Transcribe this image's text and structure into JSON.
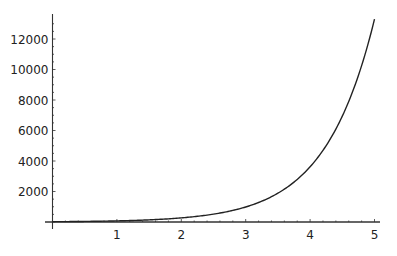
{
  "chart_data": {
    "type": "line",
    "title": "",
    "xlabel": "",
    "ylabel": "",
    "xlim": [
      0,
      5
    ],
    "ylim": [
      0,
      13300
    ],
    "grid": false,
    "legend": null,
    "x_ticks": [
      "1",
      "2",
      "3",
      "4",
      "5"
    ],
    "y_ticks": [
      "2000",
      "4000",
      "6000",
      "8000",
      "10000",
      "12000"
    ],
    "series": [
      {
        "name": "curve",
        "x": [
          0,
          0.5,
          1,
          1.5,
          2,
          2.5,
          3,
          3.5,
          4,
          4.5,
          5
        ],
        "values": [
          20,
          38,
          73,
          140,
          270,
          515,
          985,
          1890,
          3620,
          6940,
          13300
        ]
      }
    ],
    "colors": {
      "line": "#222222",
      "axis": "#333333",
      "background": "#ffffff"
    }
  }
}
